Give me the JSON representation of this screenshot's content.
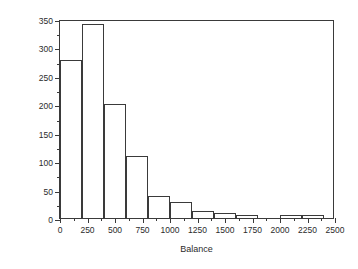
{
  "chart_data": {
    "type": "bar",
    "title": "",
    "subtitle": "",
    "xlabel": "Balance",
    "ylabel": "Count",
    "xlim": [
      0,
      2500
    ],
    "ylim": [
      0,
      350
    ],
    "grid": false,
    "legend": null,
    "bin_width": 200,
    "x_ticks": [
      0,
      250,
      500,
      750,
      1000,
      1250,
      1500,
      1750,
      2000,
      2250,
      2500
    ],
    "x_tick_labels": [
      "0",
      "250",
      "500",
      "750",
      "1000",
      "1250",
      "1500",
      "1750",
      "2000",
      "2250",
      "2500"
    ],
    "x_minor_ticks": [
      125,
      375,
      625,
      875,
      1125,
      1375,
      1625,
      1875,
      2125,
      2375
    ],
    "y_ticks": [
      0,
      50,
      100,
      150,
      200,
      250,
      300,
      350
    ],
    "y_tick_labels": [
      "0",
      "50",
      "100",
      "150",
      "200",
      "250",
      "300",
      "350"
    ],
    "y_minor_ticks": [
      25,
      75,
      125,
      175,
      225,
      275,
      325
    ],
    "bin_edges": [
      0,
      200,
      400,
      600,
      800,
      1000,
      1200,
      1400,
      1600,
      1800,
      2000,
      2200,
      2400
    ],
    "categories": [
      "0-200",
      "200-400",
      "400-600",
      "600-800",
      "800-1000",
      "1000-1200",
      "1200-1400",
      "1400-1600",
      "1600-1800",
      "1800-2000",
      "2000-2200",
      "2200-2400"
    ],
    "values": [
      278,
      341,
      200,
      109,
      39,
      28,
      12,
      8,
      5,
      0,
      5,
      5
    ],
    "bar_fill": "#ffffff",
    "bar_edge": "#3a3a3a",
    "axis_color": "#3a3a3a",
    "text_color": "#2b2b2b",
    "background": "#ffffff"
  }
}
